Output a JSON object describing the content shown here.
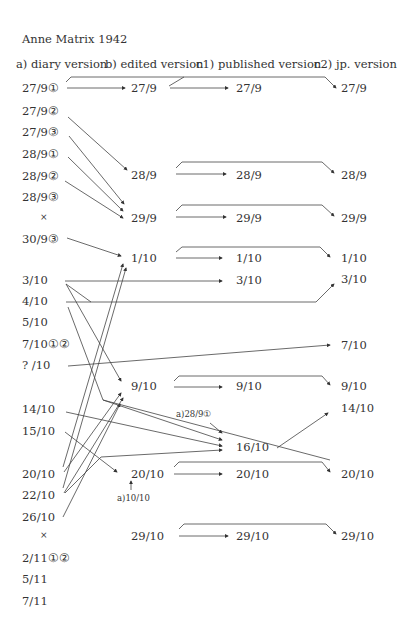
{
  "title": "Anne Matrix 1942",
  "headers": [
    "a) diary version",
    "b) edited version",
    "c1) published version",
    "c2) jp. version"
  ],
  "columns": {
    "a": [
      {
        "label": "27/9①",
        "y": 89
      },
      {
        "label": "27/9②",
        "y": 112
      },
      {
        "label": "27/9③",
        "y": 133
      },
      {
        "label": "28/9①",
        "y": 155
      },
      {
        "label": "28/9②",
        "y": 177
      },
      {
        "label": "28/9③",
        "y": 198
      },
      {
        "label": "×",
        "y": 219
      },
      {
        "label": "30/9③",
        "y": 240
      },
      {
        "label": "3/10",
        "y": 281
      },
      {
        "label": "4/10",
        "y": 302
      },
      {
        "label": "5/10",
        "y": 323
      },
      {
        "label": "7/10①②",
        "y": 345
      },
      {
        "label": "? /10",
        "y": 366
      },
      {
        "label": "14/10",
        "y": 410
      },
      {
        "label": "15/10",
        "y": 432
      },
      {
        "label": "20/10",
        "y": 475
      },
      {
        "label": "22/10",
        "y": 496
      },
      {
        "label": "26/10",
        "y": 518
      },
      {
        "label": "×",
        "y": 537
      },
      {
        "label": "2/11①②",
        "y": 559
      },
      {
        "label": "5/11",
        "y": 580
      },
      {
        "label": "7/11",
        "y": 602
      }
    ],
    "b": [
      {
        "label": "27/9",
        "y": 89
      },
      {
        "label": "28/9",
        "y": 176
      },
      {
        "label": "29/9",
        "y": 219
      },
      {
        "label": "1/10",
        "y": 259
      },
      {
        "label": "9/10",
        "y": 387
      },
      {
        "label": "20/10",
        "y": 475
      },
      {
        "label": "29/10",
        "y": 537
      }
    ],
    "c1": [
      {
        "label": "27/9",
        "y": 89
      },
      {
        "label": "28/9",
        "y": 176
      },
      {
        "label": "29/9",
        "y": 219
      },
      {
        "label": "1/10",
        "y": 259
      },
      {
        "label": "3/10",
        "y": 281
      },
      {
        "label": "9/10",
        "y": 387
      },
      {
        "label": "16/10",
        "y": 448
      },
      {
        "label": "20/10",
        "y": 475
      },
      {
        "label": "29/10",
        "y": 537
      }
    ],
    "c2": [
      {
        "label": "27/9",
        "y": 89
      },
      {
        "label": "28/9",
        "y": 176
      },
      {
        "label": "29/9",
        "y": 219
      },
      {
        "label": "1/10",
        "y": 259
      },
      {
        "label": "3/10",
        "y": 280
      },
      {
        "label": "7/10",
        "y": 346
      },
      {
        "label": "9/10",
        "y": 387
      },
      {
        "label": "14/10",
        "y": 409
      },
      {
        "label": "20/10",
        "y": 475
      },
      {
        "label": "29/10",
        "y": 537
      }
    ]
  },
  "notes": [
    {
      "label": "a)28/9①",
      "x": 176,
      "y": 414
    },
    {
      "label": "a)10/10",
      "x": 117,
      "y": 498
    }
  ]
}
